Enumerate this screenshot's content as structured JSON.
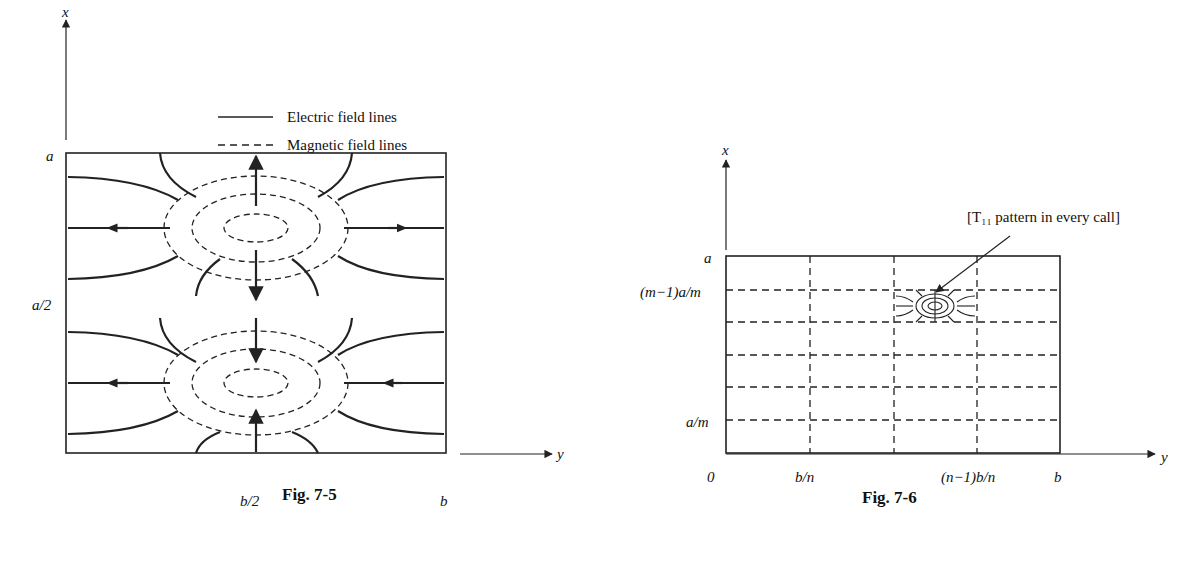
{
  "figures": [
    {
      "caption": "Fig. 7-5",
      "axes": {
        "vertical": "x",
        "horizontal": "y"
      },
      "y_ticks": [
        "a",
        "a/2"
      ],
      "x_ticks": [
        "b/2",
        "b"
      ],
      "legend": [
        {
          "style": "solid",
          "label": "Electric field lines"
        },
        {
          "style": "dashed",
          "label": "Magnetic field lines"
        }
      ]
    },
    {
      "caption": "Fig. 7-6",
      "axes": {
        "vertical": "x",
        "horizontal": "y"
      },
      "y_ticks": [
        "a",
        "(m−1)a/m",
        "a/m"
      ],
      "x_ticks": [
        "0",
        "b/n",
        "(n−1)b/n",
        "b"
      ],
      "annotation": "[T₁₁ pattern in every call]"
    }
  ]
}
